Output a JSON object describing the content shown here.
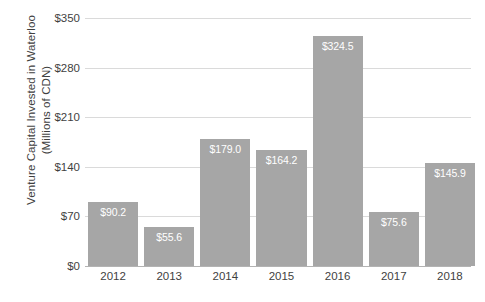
{
  "chart_data": {
    "type": "bar",
    "title": "",
    "xlabel": "",
    "ylabel_lines": [
      "Venture Capital Invested in Waterloo",
      "(Millions of CDN)"
    ],
    "categories": [
      "2012",
      "2013",
      "2014",
      "2015",
      "2016",
      "2017",
      "2018"
    ],
    "values": [
      90.2,
      55.6,
      179.0,
      164.2,
      324.5,
      75.6,
      145.9
    ],
    "data_labels": [
      "$90.2",
      "$55.6",
      "$179.0",
      "$164.2",
      "$324.5",
      "$75.6",
      "$145.9"
    ],
    "ylim": [
      0,
      350
    ],
    "yticks": [
      0,
      70,
      140,
      210,
      280,
      350
    ],
    "ytick_labels": [
      "$0",
      "$70",
      "$140",
      "$210",
      "$280",
      "$350"
    ],
    "grid": true,
    "legend": "none",
    "colors": {
      "bar": "#a6a6a6",
      "gridline": "#dadada",
      "axis": "#b3b3b3",
      "text": "#3f3f3f",
      "data_label": "#ffffff",
      "background": "#ffffff"
    }
  }
}
